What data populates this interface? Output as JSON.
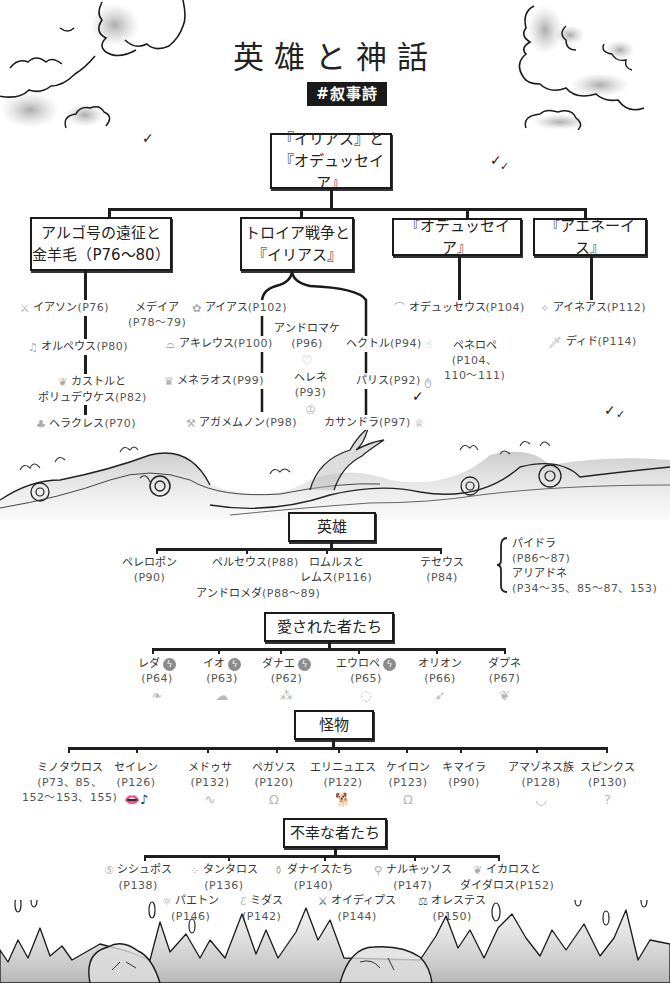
{
  "header": {
    "title": "英雄と神話",
    "tag": "#叙事詩"
  },
  "root": {
    "line1": "『イリアス』と",
    "line2": "『オデュッセイア』"
  },
  "branches": [
    {
      "line1": "アルゴ号の遠征と",
      "line2": "金羊毛（P76〜80）",
      "items": [
        {
          "name": "イアソン",
          "page": "(P76)",
          "icon": "sword-icon"
        },
        {
          "name": "メデイア",
          "page": "(P78〜79)",
          "icon": ""
        },
        {
          "name": "オルペウス",
          "page": "(P80)",
          "icon": "lyre-icon"
        },
        {
          "name": "カストルと",
          "name2": "ポリュデウケス",
          "page": "(P82)",
          "icon": "swan-icon"
        },
        {
          "name": "ヘラクレス",
          "page": "(P70)",
          "icon": "club-icon"
        }
      ]
    },
    {
      "line1": "トロイア戦争と",
      "line2": "『イリアス』",
      "items": [
        {
          "name": "アイアス",
          "page": "(P102)",
          "icon": "flower-icon"
        },
        {
          "name": "アキレウス",
          "page": "(P100)",
          "icon": "heel-icon"
        },
        {
          "name": "メネラオス",
          "page": "(P99)",
          "icon": "crown-icon"
        },
        {
          "name": "アガメムノン",
          "page": "(P98)",
          "icon": "axe-icon"
        },
        {
          "name": "アンドロマケ",
          "page": "(P96)",
          "icon": "broken-heart-icon"
        },
        {
          "name": "ヘレネ",
          "page": "(P93)",
          "icon": "tiara-icon"
        },
        {
          "name": "ヘクトル",
          "page": "(P94)",
          "icon": "hand-icon"
        },
        {
          "name": "パリス",
          "page": "(P92)",
          "icon": "apple-icon"
        },
        {
          "name": "カサンドラ",
          "page": "(P97)",
          "icon": "bulb-icon"
        }
      ]
    },
    {
      "line1": "『オデュッセイア』",
      "items": [
        {
          "name": "オデュッセウス",
          "page": "(P104)",
          "icon": "boat-icon"
        },
        {
          "name": "ペネロペ",
          "page": "(P104、",
          "page2": "110〜111)",
          "icon": ""
        }
      ]
    },
    {
      "line1": "『アエネーイス』",
      "items": [
        {
          "name": "アイネアス",
          "page": "(P112)",
          "icon": "sparkle-icon"
        },
        {
          "name": "ディド",
          "page": "(P114)",
          "icon": "knife-icon"
        }
      ]
    }
  ],
  "heroes": {
    "label": "英雄",
    "items": [
      {
        "name": "ペレロポン",
        "page": "(P90)"
      },
      {
        "name": "ペルセウス",
        "page": "(P88)"
      },
      {
        "name": "ロムルスと",
        "name2": "レムス",
        "page": "(P116)"
      },
      {
        "name": "テセウス",
        "page": "(P84)"
      }
    ],
    "sub": {
      "name": "アンドロメダ",
      "page": "(P88〜89)"
    },
    "bracket": [
      {
        "name": "パイドラ",
        "page": "(P86〜87)"
      },
      {
        "name": "アリアドネ",
        "page": "(P34〜35、85〜87、153)"
      }
    ]
  },
  "loved": {
    "label": "愛された者たち",
    "items": [
      {
        "name": "レダ",
        "page": "(P64)",
        "bolt": true,
        "icon": "feather-icon"
      },
      {
        "name": "イオ",
        "page": "(P63)",
        "bolt": true,
        "icon": "cloud-icon"
      },
      {
        "name": "ダナエ",
        "page": "(P62)",
        "bolt": true,
        "icon": "gold-rain-icon"
      },
      {
        "name": "エウロペ",
        "page": "(P65)",
        "bolt": true,
        "icon": "circle-icon"
      },
      {
        "name": "オリオン",
        "page": "(P66)",
        "bolt": false,
        "icon": "arrow-icon"
      },
      {
        "name": "ダプネ",
        "page": "(P67)",
        "bolt": false,
        "icon": "leaf-icon"
      }
    ]
  },
  "monsters": {
    "label": "怪物",
    "items": [
      {
        "name": "ミノタウロス",
        "page": "(P73、85、",
        "page2": "152〜153、155)",
        "icon": ""
      },
      {
        "name": "セイレン",
        "page": "(P126)",
        "icon": "lips-icon"
      },
      {
        "name": "メドゥサ",
        "page": "(P132)",
        "icon": "snake-icon"
      },
      {
        "name": "ペガソス",
        "page": "(P120)",
        "icon": "horseshoe-icon"
      },
      {
        "name": "エリニュエス",
        "page": "(P122)",
        "icon": "dog-icon"
      },
      {
        "name": "ケイロン",
        "page": "(P123)",
        "icon": "horseshoe-icon"
      },
      {
        "name": "キマイラ",
        "page": "(P90)",
        "icon": ""
      },
      {
        "name": "アマゾネス族",
        "page": "(P128)",
        "icon": "target-icon"
      },
      {
        "name": "スピンクス",
        "page": "(P130)",
        "icon": "question-icon"
      }
    ]
  },
  "unfortunate": {
    "label": "不幸な者たち",
    "items": [
      {
        "name": "シシュポス",
        "page": "(P138)",
        "icon": "rock-icon"
      },
      {
        "name": "タンタロス",
        "page": "(P136)",
        "icon": "grape-icon"
      },
      {
        "name": "ダナイスたち",
        "page": "(P140)",
        "icon": "jar-icon"
      },
      {
        "name": "ナルキッソス",
        "page": "(P147)",
        "icon": "mirror-icon"
      },
      {
        "name": "イカロスと",
        "name2": "ダイダロス",
        "page": "(P152)",
        "icon": "wings-icon"
      },
      {
        "name": "パエトン",
        "page": "(P146)",
        "icon": "sun-icon"
      },
      {
        "name": "ミダス",
        "page": "(P142)",
        "icon": "ear-icon"
      },
      {
        "name": "オイディプス",
        "page": "(P144)",
        "icon": "dagger-icon"
      },
      {
        "name": "オレステス",
        "page": "(P150)",
        "icon": "scales-icon"
      }
    ]
  },
  "icons": {
    "bolt": "ϟ",
    "check": "✓"
  }
}
